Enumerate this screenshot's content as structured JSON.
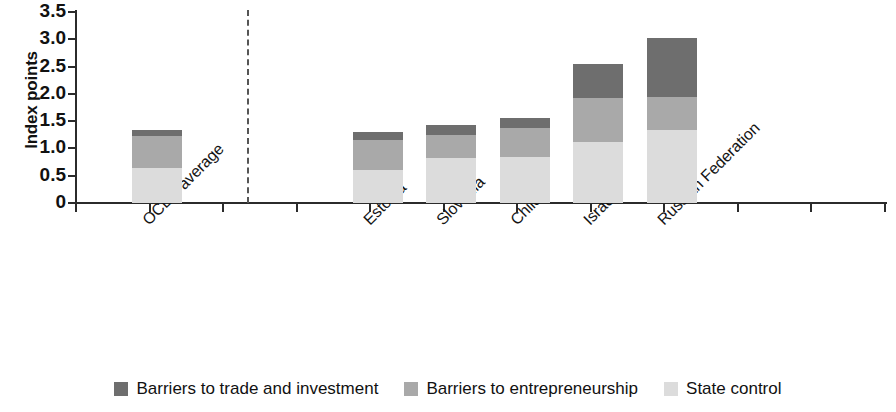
{
  "chart_data": {
    "type": "bar",
    "subtype": "stacked-bar",
    "title": "",
    "xlabel": "",
    "ylabel": "Index points",
    "ylim": [
      0,
      3.5
    ],
    "grid": false,
    "legend_position": "bottom",
    "y_ticks": [
      "0",
      "0.5",
      "1.0",
      "1.5",
      "2.0",
      "2.5",
      "3.0",
      "3.5"
    ],
    "y_tick_values": [
      0,
      0.5,
      1.0,
      1.5,
      2.0,
      2.5,
      3.0,
      3.5
    ],
    "categories": [
      "OCED average",
      "Estonia",
      "Slovenia",
      "Chile",
      "Israel",
      "Russian Federation"
    ],
    "series": [
      {
        "name": "State control",
        "color": "#dcdcdc",
        "values": [
          0.64,
          0.6,
          0.82,
          0.84,
          1.12,
          1.34
        ]
      },
      {
        "name": "Barriers to entrepreneurship",
        "color": "#a9a9a9",
        "values": [
          0.59,
          0.55,
          0.43,
          0.53,
          0.81,
          0.6
        ]
      },
      {
        "name": "Barriers to trade and investment",
        "color": "#6e6e6e",
        "values": [
          0.11,
          0.15,
          0.18,
          0.19,
          0.62,
          1.08
        ]
      }
    ],
    "totals": [
      1.34,
      1.3,
      1.43,
      1.56,
      2.55,
      3.02
    ],
    "annotations": {
      "separator": "dashed vertical line after OCED average"
    }
  },
  "legend": {
    "items": [
      {
        "label": "Barriers to trade and investment",
        "color": "#6e6e6e"
      },
      {
        "label": "Barriers to entrepreneurship",
        "color": "#a9a9a9"
      },
      {
        "label": "State control",
        "color": "#dcdcdc"
      }
    ]
  }
}
